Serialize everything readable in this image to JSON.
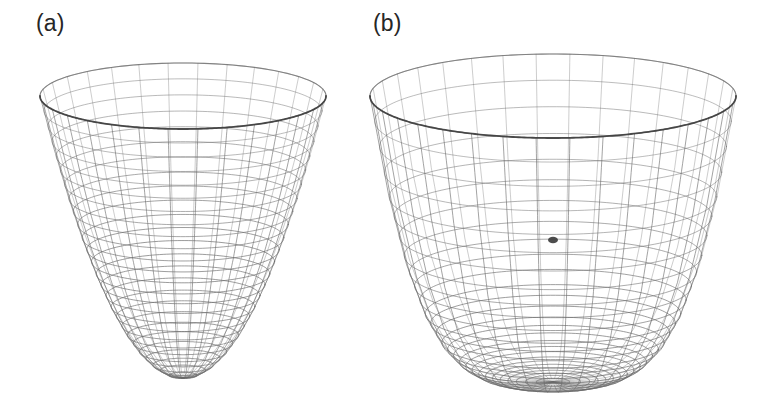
{
  "figure": {
    "background_color": "#ffffff",
    "width": 764,
    "height": 402,
    "mesh_color": "#6a6a6a",
    "mesh_color_dark": "#3a3a3a",
    "label_color": "#262626"
  },
  "panels": [
    {
      "key": "a",
      "label": "(a)",
      "plot_type": "surface-wireframe-3d"
    },
    {
      "key": "b",
      "label": "(b)",
      "plot_type": "surface-wireframe-3d"
    }
  ],
  "chart_data": [
    {
      "type": "surface",
      "id": "panel-a",
      "title": "(a)",
      "subtitle": "",
      "xlabel": "",
      "ylabel": "",
      "zlabel": "",
      "surface_form": "paraboloid",
      "equation": "z = a*(x^2 + y^2)",
      "render_style": "wireframe-mesh",
      "mesh_color": "#6a6a6a",
      "grid": true,
      "legend": "none",
      "axes_visible": false,
      "tick_labels": [],
      "view": {
        "elevation_deg": 28,
        "azimuth_deg": 0,
        "projection": "perspective"
      },
      "geometry": {
        "rim_center_x": 183,
        "rim_center_y": 96,
        "rim_radius_x": 143,
        "rim_radius_y": 33,
        "vertex_x": 183,
        "vertex_y": 378,
        "depth_px": 282,
        "aspect": "narrow-deep",
        "meridians": 30,
        "rings": 26
      },
      "radial_profile": {
        "r_normalized": [
          0.0,
          0.1,
          0.2,
          0.3,
          0.4,
          0.5,
          0.6,
          0.7,
          0.8,
          0.9,
          1.0
        ],
        "z_normalized": [
          0.0,
          0.01,
          0.04,
          0.09,
          0.16,
          0.25,
          0.36,
          0.49,
          0.64,
          0.81,
          1.0
        ]
      },
      "xlim": [
        -1,
        1
      ],
      "ylim": [
        -1,
        1
      ],
      "zlim": [
        0,
        1
      ]
    },
    {
      "type": "surface",
      "id": "panel-b",
      "title": "(b)",
      "subtitle": "",
      "xlabel": "",
      "ylabel": "",
      "zlabel": "",
      "surface_form": "flat-bottomed-bowl",
      "equation": "z = a*(x^2 + y^2)^2",
      "render_style": "wireframe-mesh",
      "mesh_color": "#6a6a6a",
      "grid": true,
      "legend": "none",
      "axes_visible": false,
      "tick_labels": [],
      "view": {
        "elevation_deg": 28,
        "azimuth_deg": 0,
        "projection": "perspective"
      },
      "geometry": {
        "rim_center_x": 553,
        "rim_center_y": 96,
        "rim_radius_x": 183,
        "rim_radius_y": 42,
        "vertex_x": 553,
        "vertex_y": 382,
        "depth_px": 286,
        "aspect": "wide-shallow",
        "meridians": 34,
        "rings": 28,
        "interior_vertex_marker": {
          "x": 553,
          "y": 240
        }
      },
      "radial_profile": {
        "r_normalized": [
          0.0,
          0.1,
          0.2,
          0.3,
          0.4,
          0.5,
          0.6,
          0.7,
          0.8,
          0.9,
          1.0
        ],
        "z_normalized": [
          0.0,
          0.0,
          0.002,
          0.008,
          0.026,
          0.063,
          0.13,
          0.24,
          0.41,
          0.66,
          1.0
        ]
      },
      "xlim": [
        -1,
        1
      ],
      "ylim": [
        -1,
        1
      ],
      "zlim": [
        0,
        1
      ]
    }
  ]
}
